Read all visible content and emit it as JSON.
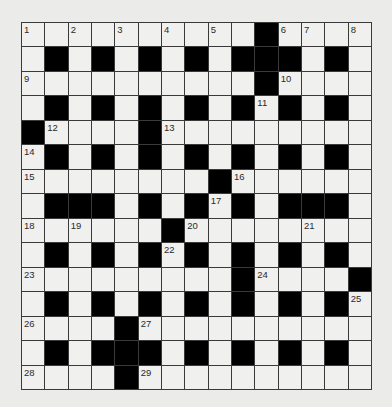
{
  "puzzle": {
    "type": "crossword",
    "rows": 15,
    "cols": 15,
    "colors": {
      "background": "#ebebea",
      "cell": "#f0f0ef",
      "block": "#000000",
      "grid_line": "#3a3a3a",
      "number_text": "#2a2a2a"
    },
    "grid": [
      "..........#....",
      ".#.#.#.#.###.#.",
      "..........#....",
      ".#.#.#.#.#.#.#.",
      "#....#.........",
      ".#.#.#.#.#.#.#.",
      "........#......",
      ".###.#.#.#.###.",
      "......#........",
      ".#.#.#.#.#.#.#.",
      ".........#....#",
      ".#.#.#.#.#.#.#.",
      "....#..........",
      ".#.###.#.#.#.#.",
      "....#.........."
    ],
    "numbers": [
      {
        "row": 0,
        "col": 0,
        "n": "1"
      },
      {
        "row": 0,
        "col": 2,
        "n": "2"
      },
      {
        "row": 0,
        "col": 4,
        "n": "3"
      },
      {
        "row": 0,
        "col": 6,
        "n": "4"
      },
      {
        "row": 0,
        "col": 8,
        "n": "5"
      },
      {
        "row": 0,
        "col": 11,
        "n": "6"
      },
      {
        "row": 0,
        "col": 12,
        "n": "7"
      },
      {
        "row": 0,
        "col": 14,
        "n": "8"
      },
      {
        "row": 2,
        "col": 0,
        "n": "9"
      },
      {
        "row": 2,
        "col": 11,
        "n": "10"
      },
      {
        "row": 3,
        "col": 10,
        "n": "11"
      },
      {
        "row": 4,
        "col": 1,
        "n": "12"
      },
      {
        "row": 4,
        "col": 6,
        "n": "13"
      },
      {
        "row": 5,
        "col": 0,
        "n": "14"
      },
      {
        "row": 6,
        "col": 0,
        "n": "15"
      },
      {
        "row": 6,
        "col": 9,
        "n": "16"
      },
      {
        "row": 7,
        "col": 8,
        "n": "17"
      },
      {
        "row": 8,
        "col": 0,
        "n": "18"
      },
      {
        "row": 8,
        "col": 2,
        "n": "19"
      },
      {
        "row": 8,
        "col": 7,
        "n": "20"
      },
      {
        "row": 8,
        "col": 12,
        "n": "21"
      },
      {
        "row": 9,
        "col": 6,
        "n": "22"
      },
      {
        "row": 10,
        "col": 0,
        "n": "23"
      },
      {
        "row": 10,
        "col": 10,
        "n": "24"
      },
      {
        "row": 11,
        "col": 14,
        "n": "25"
      },
      {
        "row": 12,
        "col": 0,
        "n": "26"
      },
      {
        "row": 12,
        "col": 5,
        "n": "27"
      },
      {
        "row": 14,
        "col": 0,
        "n": "28"
      },
      {
        "row": 14,
        "col": 5,
        "n": "29"
      }
    ]
  }
}
